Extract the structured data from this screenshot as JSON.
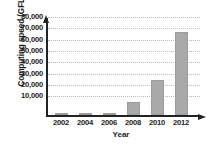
{
  "chart_data": {
    "type": "bar",
    "title": "",
    "subtitle": "",
    "xlabel": "Year",
    "ylabel": "Computing speed (GFLOPS)",
    "categories": [
      "2002",
      "2004",
      "2006",
      "2008",
      "2010",
      "2012"
    ],
    "values": [
      400,
      1000,
      1800,
      12000,
      31000,
      74000
    ],
    "series": [
      {
        "name": "Computing speed",
        "values": [
          400,
          1000,
          1800,
          12000,
          31000,
          74000
        ]
      }
    ],
    "ylim": [
      0,
      80000
    ],
    "xlim_categories": 6,
    "ytick_values": [
      80000,
      70000,
      60000,
      50000,
      40000,
      30000,
      20000,
      10000
    ],
    "ytick_labels": [
      "80,000",
      "70,000",
      "60,000",
      "50,000",
      "40,000",
      "30,000",
      "20,000",
      "10,000"
    ],
    "xtick_labels": [
      "2002",
      "2004",
      "2006",
      "2008",
      "2010",
      "2012"
    ],
    "grid": "horizontal-dotted",
    "legend": "none",
    "legend_position": "none",
    "annotations": [],
    "colors": {
      "bar_fill": "#a9a9a9",
      "bar_stroke": "#9c9c9c",
      "axis": "#232323",
      "gridline": "#b9b9b9",
      "text": "#1b1b1b",
      "background": "#ffffff"
    }
  }
}
